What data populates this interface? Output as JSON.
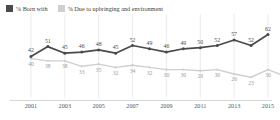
{
  "legend": {
    "position": "top-left",
    "items": [
      {
        "label": "% Born with",
        "color": "#4a4a4a",
        "swatch": "dark"
      },
      {
        "label": "% Due to upbringing and environment",
        "color": "#cfcfcf",
        "swatch": "light"
      }
    ]
  },
  "chart_data": {
    "type": "line",
    "title": "",
    "subtitle": "",
    "xlabel": "",
    "ylabel": "",
    "grid": "vertical-only",
    "legend_position": "top-left",
    "ylim": [
      15,
      68
    ],
    "x": [
      2000,
      2001,
      2002,
      2003,
      2004,
      2005,
      2006,
      2007,
      2008,
      2009,
      2010,
      2011,
      2012,
      2013,
      2014,
      2015
    ],
    "tick_labels": [
      "2001",
      "2003",
      "2005",
      "2007",
      "2009",
      "2011",
      "2013",
      "2015"
    ],
    "tick_values": [
      2001,
      2003,
      2005,
      2007,
      2009,
      2011,
      2013,
      2015
    ],
    "series": [
      {
        "name": "% Born with",
        "color": "#4a4a4a",
        "values": [
          42,
          51,
          45,
          46,
          48,
          45,
          52,
          49,
          46,
          49,
          50,
          52,
          57,
          52,
          62
        ],
        "x": [
          2001,
          2002,
          2003,
          2004,
          2005,
          2006,
          2007,
          2008,
          2009,
          2010,
          2011,
          2012,
          2013,
          2014,
          2015
        ]
      },
      {
        "name": "% Due to upbringing and environment",
        "color": "#cfcfcf",
        "values": [
          40,
          38,
          38,
          33,
          35,
          32,
          34,
          32,
          30,
          30,
          29,
          30,
          26,
          23,
          30,
          24
        ],
        "x": [
          2001,
          2002,
          2003,
          2004,
          2005,
          2006,
          2007,
          2008,
          2009,
          2010,
          2011,
          2012,
          2013,
          2014,
          2015,
          2016
        ]
      }
    ]
  }
}
